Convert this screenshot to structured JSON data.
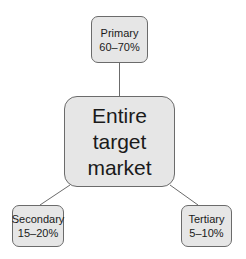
{
  "diagram": {
    "center": {
      "lines": [
        "Entire",
        "target",
        "market"
      ]
    },
    "nodes": [
      {
        "id": "primary",
        "label": "Primary",
        "value": "60–70%"
      },
      {
        "id": "secondary",
        "label": "Secondary",
        "value": "15–20%"
      },
      {
        "id": "tertiary",
        "label": "Tertiary",
        "value": "5–10%"
      }
    ],
    "colors": {
      "box_fill": "#e6e6e6",
      "border": "#6b6b6b",
      "line": "#6b6b6b"
    }
  }
}
